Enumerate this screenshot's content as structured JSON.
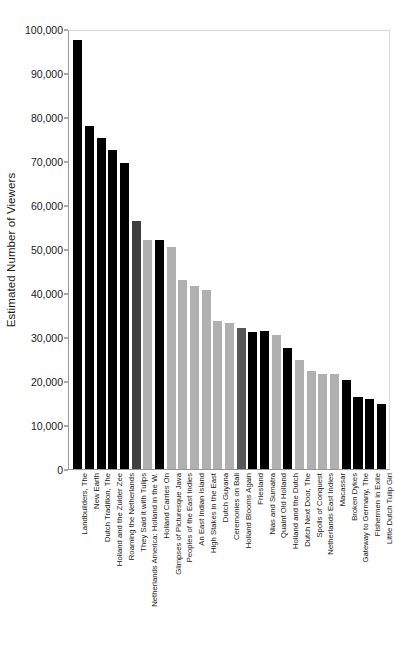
{
  "chart_data": {
    "type": "bar",
    "title": "",
    "xlabel": "",
    "ylabel": "Estimated Number of Viewers",
    "ylim": [
      0,
      100000
    ],
    "grid": false,
    "legend": null,
    "ytick_labels": [
      "100,000",
      "90,000",
      "80,000",
      "70,000",
      "60,000",
      "50,000",
      "40,000",
      "30,000",
      "20,000",
      "10,000",
      "0"
    ],
    "ytick_values": [
      100000,
      90000,
      80000,
      70000,
      60000,
      50000,
      40000,
      30000,
      20000,
      10000,
      0
    ],
    "categories": [
      "Landbuilders, The",
      "New Earth",
      "Dutch Tradition, The",
      "Holland and the Zuider Zee",
      "Roaming the Netherlands",
      "They Said it with Tulips",
      "Netherlands America: Holland in the W.",
      "Holland Carries On",
      "Glimpses of Picturesque Java",
      "Peoples of the East Indies",
      "An East Indian Island",
      "High Stakes in the East",
      "Dutch Guyana",
      "Ceremonies on Bali",
      "Holland Blooms Again",
      "Friesland",
      "Nias and Sumatra",
      "Quaint Old Holland",
      "Holland and the Dutch",
      "Dutch Next Door, The",
      "Spoils of Conquest",
      "Netherlands East Indies",
      "Macassar",
      "Broken Dykes",
      "Gateway to Germany, The",
      "Fishermen in Exile",
      "Little Dutch Tulip Girl"
    ],
    "values": [
      97400,
      78000,
      75300,
      72600,
      69500,
      56400,
      52000,
      52100,
      50400,
      43000,
      41700,
      40700,
      33700,
      33200,
      32000,
      31200,
      31300,
      30500,
      27400,
      24700,
      22300,
      21600,
      21500,
      20300,
      16300,
      16000,
      14800
    ],
    "bar_colors": [
      "#000000",
      "#000000",
      "#000000",
      "#000000",
      "#000000",
      "#3f3f3f",
      "#b0b0b0",
      "#000000",
      "#b0b0b0",
      "#b0b0b0",
      "#b0b0b0",
      "#b0b0b0",
      "#b0b0b0",
      "#b0b0b0",
      "#575757",
      "#000000",
      "#000000",
      "#b0b0b0",
      "#000000",
      "#b0b0b0",
      "#b0b0b0",
      "#b0b0b0",
      "#b0b0b0",
      "#000000",
      "#000000",
      "#000000",
      "#000000"
    ],
    "axis_color": "#999999",
    "text_color": "#1a1a1a",
    "background": "#ffffff"
  }
}
